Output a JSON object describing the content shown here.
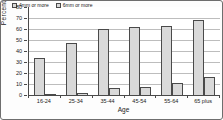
{
  "chart_data": {
    "type": "bar",
    "title": "",
    "categories": [
      "16-24",
      "25-34",
      "35-44",
      "45-54",
      "55-64",
      "65 plus"
    ],
    "series": [
      {
        "name": "4mm or more",
        "values": [
          34,
          47,
          60,
          62,
          63,
          68
        ]
      },
      {
        "name": "6mm or more",
        "values": [
          1,
          2,
          6,
          7,
          11,
          16
        ]
      }
    ],
    "xlabel": "Age",
    "ylabel": "Percentage",
    "ylim": [
      0,
      80
    ],
    "ytick_step": 10,
    "grid": true,
    "legend_position": "top-inside",
    "colors": {
      "bar_fill": "#d9d9d9",
      "bar_pattern_dot": "#8f8f8f",
      "bar_border": "#4a4a4a",
      "gridline": "#bdbdbd",
      "axis": "#4a4a4a",
      "text": "#1a1a1a",
      "frame_border": "#6e6e6e",
      "background": "#fdfdfd"
    }
  }
}
